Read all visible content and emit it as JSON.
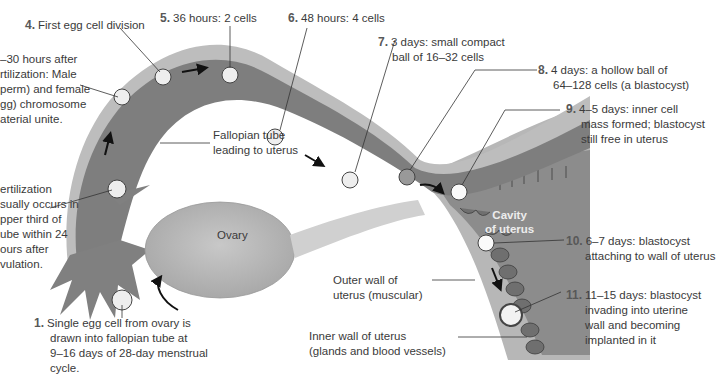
{
  "diagram": {
    "steps": [
      {
        "number": "1.",
        "lines": [
          "Single egg cell from ovary is",
          "drawn into fallopian tube at",
          "9–16 days of 28-day menstrual",
          "cycle."
        ]
      },
      {
        "number": "",
        "lines": [
          "ertilization",
          "sually occurs in",
          "pper third of",
          "ube within 24",
          "ours after",
          "vulation."
        ]
      },
      {
        "number": "",
        "lines": [
          "–30 hours after",
          "rtilization: Male",
          "perm) and female",
          "gg) chromosome",
          "aterial unite."
        ]
      },
      {
        "number": "4.",
        "lines": [
          "First egg cell division"
        ]
      },
      {
        "number": "5.",
        "lines": [
          "36 hours: 2 cells"
        ]
      },
      {
        "number": "6.",
        "lines": [
          "48 hours: 4 cells"
        ]
      },
      {
        "number": "7.",
        "lines": [
          "3 days: small compact",
          "ball of 16–32 cells"
        ]
      },
      {
        "number": "8.",
        "lines": [
          "4 days: a hollow ball of",
          "64–128 cells (a blastocyst)"
        ]
      },
      {
        "number": "9.",
        "lines": [
          "4–5 days: inner cell",
          "mass formed; blastocyst",
          "still free in uterus"
        ]
      },
      {
        "number": "10.",
        "lines": [
          "6–7 days: blastocyst",
          "attaching to wall of uterus"
        ]
      },
      {
        "number": "11.",
        "lines": [
          "11–15 days: blastocyst",
          "invading into uterine",
          "wall and becoming",
          "implanted in it"
        ]
      }
    ],
    "structures": {
      "fallopian_tube": [
        "Fallopian tube",
        "leading to uterus"
      ],
      "ovary": "Ovary",
      "cavity": [
        "Cavity",
        "of uterus"
      ],
      "outer_wall": [
        "Outer wall of",
        "uterus (muscular)"
      ],
      "inner_wall": [
        "Inner wall of uterus",
        "(glands and blood vessels)"
      ]
    },
    "colors": {
      "tube_outer": "#b9b9b9",
      "tube_inner": "#7d7d7d",
      "uterus_wall": "#a5a5a5",
      "uterus_cavity": "#8a8a8a",
      "ovary": "#b0b0b0",
      "text": "#3a3a3a"
    }
  }
}
